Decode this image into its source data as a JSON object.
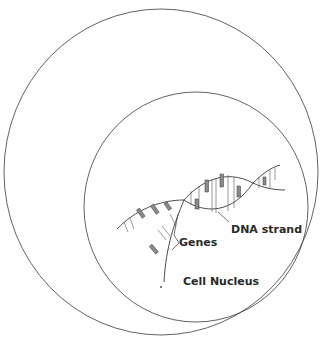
{
  "diagram": {
    "type": "nested-containment",
    "outer_circle": {
      "label": ""
    },
    "nucleus": {
      "label": "Cell Nucleus"
    },
    "dna": {
      "label": "DNA strand"
    },
    "genes": {
      "label": "Genes"
    }
  },
  "colors": {
    "line": "#3a3a3a",
    "bar": "#8a8a8a",
    "text": "#2a2a2a",
    "background": "#ffffff"
  }
}
